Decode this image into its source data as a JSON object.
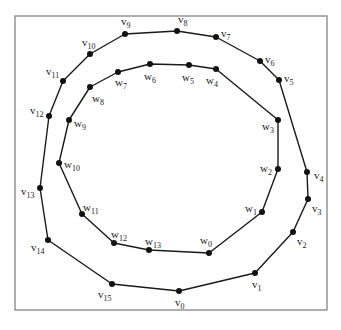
{
  "diagram": {
    "type": "nested-polygons",
    "frame": {
      "x": 15,
      "y": 16,
      "width": 312,
      "height": 294
    },
    "outer_polygon": {
      "name": "v",
      "closed": true,
      "vertices": [
        {
          "id": "v0",
          "base": "v",
          "sub": "0",
          "x": 179,
          "y": 291,
          "lx": 175,
          "ly": 306
        },
        {
          "id": "v1",
          "base": "v",
          "sub": "1",
          "x": 255,
          "y": 273,
          "lx": 252,
          "ly": 288
        },
        {
          "id": "v2",
          "base": "v",
          "sub": "2",
          "x": 293,
          "y": 232,
          "lx": 297,
          "ly": 245
        },
        {
          "id": "v3",
          "base": "v",
          "sub": "3",
          "x": 308,
          "y": 199,
          "lx": 312,
          "ly": 212
        },
        {
          "id": "v4",
          "base": "v",
          "sub": "4",
          "x": 307,
          "y": 172,
          "lx": 314,
          "ly": 179
        },
        {
          "id": "v5",
          "base": "v",
          "sub": "5",
          "x": 279,
          "y": 80,
          "lx": 284,
          "ly": 82
        },
        {
          "id": "v6",
          "base": "v",
          "sub": "6",
          "x": 260,
          "y": 61,
          "lx": 265,
          "ly": 63
        },
        {
          "id": "v7",
          "base": "v",
          "sub": "7",
          "x": 216,
          "y": 37,
          "lx": 221,
          "ly": 37
        },
        {
          "id": "v8",
          "base": "v",
          "sub": "8",
          "x": 177,
          "y": 31,
          "lx": 178,
          "ly": 23
        },
        {
          "id": "v9",
          "base": "v",
          "sub": "9",
          "x": 125,
          "y": 34,
          "lx": 121,
          "ly": 25
        },
        {
          "id": "v10",
          "base": "v",
          "sub": "10",
          "x": 90,
          "y": 54,
          "lx": 82,
          "ly": 46
        },
        {
          "id": "v11",
          "base": "v",
          "sub": "11",
          "x": 63,
          "y": 81,
          "lx": 46,
          "ly": 75
        },
        {
          "id": "v12",
          "base": "v",
          "sub": "12",
          "x": 49,
          "y": 116,
          "lx": 30,
          "ly": 114
        },
        {
          "id": "v13",
          "base": "v",
          "sub": "13",
          "x": 40,
          "y": 188,
          "lx": 21,
          "ly": 195
        },
        {
          "id": "v14",
          "base": "v",
          "sub": "14",
          "x": 48,
          "y": 240,
          "lx": 31,
          "ly": 251
        },
        {
          "id": "v15",
          "base": "v",
          "sub": "15",
          "x": 112,
          "y": 284,
          "lx": 98,
          "ly": 298
        }
      ]
    },
    "inner_polygon": {
      "name": "w",
      "closed": true,
      "vertices": [
        {
          "id": "w0",
          "base": "w",
          "sub": "0",
          "x": 209,
          "y": 253,
          "lx": 200,
          "ly": 244
        },
        {
          "id": "w1",
          "base": "w",
          "sub": "1",
          "x": 262,
          "y": 212,
          "lx": 245,
          "ly": 212
        },
        {
          "id": "w2",
          "base": "w",
          "sub": "2",
          "x": 278,
          "y": 169,
          "lx": 260,
          "ly": 172
        },
        {
          "id": "w3",
          "base": "w",
          "sub": "3",
          "x": 278,
          "y": 120,
          "lx": 262,
          "ly": 130
        },
        {
          "id": "w4",
          "base": "w",
          "sub": "4",
          "x": 216,
          "y": 69,
          "lx": 206,
          "ly": 84
        },
        {
          "id": "w5",
          "base": "w",
          "sub": "5",
          "x": 189,
          "y": 65,
          "lx": 182,
          "ly": 81
        },
        {
          "id": "w6",
          "base": "w",
          "sub": "6",
          "x": 150,
          "y": 64,
          "lx": 144,
          "ly": 80
        },
        {
          "id": "w7",
          "base": "w",
          "sub": "7",
          "x": 118,
          "y": 72,
          "lx": 115,
          "ly": 86
        },
        {
          "id": "w8",
          "base": "w",
          "sub": "8",
          "x": 90,
          "y": 87,
          "lx": 92,
          "ly": 102
        },
        {
          "id": "w9",
          "base": "w",
          "sub": "9",
          "x": 69,
          "y": 120,
          "lx": 74,
          "ly": 127
        },
        {
          "id": "w10",
          "base": "w",
          "sub": "10",
          "x": 59,
          "y": 163,
          "lx": 64,
          "ly": 168
        },
        {
          "id": "w11",
          "base": "w",
          "sub": "11",
          "x": 82,
          "y": 214,
          "lx": 83,
          "ly": 211
        },
        {
          "id": "w12",
          "base": "w",
          "sub": "12",
          "x": 114,
          "y": 243,
          "lx": 111,
          "ly": 238
        },
        {
          "id": "w13",
          "base": "w",
          "sub": "13",
          "x": 149,
          "y": 250,
          "lx": 145,
          "ly": 245
        }
      ]
    },
    "colors": {
      "edge": "#1a1a1a",
      "node": "#111111",
      "frame": "#7a7a7a",
      "label": "#222222",
      "background": "#ffffff"
    }
  }
}
